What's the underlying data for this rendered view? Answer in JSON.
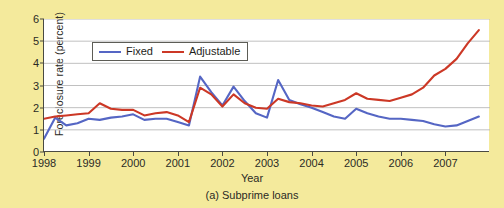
{
  "figure": {
    "caption": "(a) Subprime loans",
    "background_color": "#f4ea9c"
  },
  "chart_data": {
    "type": "line",
    "title": "",
    "xlabel": "Year",
    "ylabel": "Foreclosure rate (percent)",
    "xlim": [
      1998,
      2008
    ],
    "ylim": [
      0,
      6
    ],
    "xticks": [
      "1998",
      "1999",
      "2000",
      "2001",
      "2002",
      "2003",
      "2004",
      "2005",
      "2006",
      "2007"
    ],
    "xtick_values": [
      1998,
      1999,
      2000,
      2001,
      2002,
      2003,
      2004,
      2005,
      2006,
      2007
    ],
    "yticks": [
      "0",
      "1",
      "2",
      "3",
      "4",
      "5",
      "6"
    ],
    "ytick_values": [
      0,
      1,
      2,
      3,
      4,
      5,
      6
    ],
    "grid": "horizontal",
    "legend_position": "top-left",
    "series": [
      {
        "name": "Fixed",
        "color": "#5566c4",
        "x": [
          1998.0,
          1998.25,
          1998.5,
          1998.75,
          1999.0,
          1999.25,
          1999.5,
          1999.75,
          2000.0,
          2000.25,
          2000.5,
          2000.75,
          2001.0,
          2001.25,
          2001.5,
          2001.75,
          2002.0,
          2002.25,
          2002.5,
          2002.75,
          2003.0,
          2003.25,
          2003.5,
          2003.75,
          2004.0,
          2004.25,
          2004.5,
          2004.75,
          2005.0,
          2005.25,
          2005.5,
          2005.75,
          2006.0,
          2006.25,
          2006.5,
          2006.75,
          2007.0,
          2007.25,
          2007.5,
          2007.75
        ],
        "y": [
          0.6,
          1.55,
          1.2,
          1.3,
          1.5,
          1.45,
          1.55,
          1.6,
          1.7,
          1.45,
          1.5,
          1.5,
          1.35,
          1.2,
          3.4,
          2.7,
          2.1,
          2.95,
          2.3,
          1.75,
          1.55,
          3.25,
          2.35,
          2.15,
          2.0,
          1.8,
          1.6,
          1.5,
          1.95,
          1.75,
          1.6,
          1.5,
          1.5,
          1.45,
          1.4,
          1.25,
          1.15,
          1.2,
          1.4,
          1.6
        ]
      },
      {
        "name": "Adjustable",
        "color": "#cc3826",
        "x": [
          1998.0,
          1998.25,
          1998.5,
          1998.75,
          1999.0,
          1999.25,
          1999.5,
          1999.75,
          2000.0,
          2000.25,
          2000.5,
          2000.75,
          2001.0,
          2001.25,
          2001.5,
          2001.75,
          2002.0,
          2002.25,
          2002.5,
          2002.75,
          2003.0,
          2003.25,
          2003.5,
          2003.75,
          2004.0,
          2004.25,
          2004.5,
          2004.75,
          2005.0,
          2005.25,
          2005.5,
          2005.75,
          2006.0,
          2006.25,
          2006.5,
          2006.75,
          2007.0,
          2007.25,
          2007.5,
          2007.75
        ],
        "y": [
          1.5,
          1.6,
          1.65,
          1.7,
          1.75,
          2.2,
          1.95,
          1.9,
          1.9,
          1.65,
          1.75,
          1.8,
          1.65,
          1.35,
          2.9,
          2.6,
          2.05,
          2.6,
          2.2,
          2.0,
          1.95,
          2.4,
          2.25,
          2.2,
          2.1,
          2.05,
          2.2,
          2.35,
          2.65,
          2.4,
          2.35,
          2.3,
          2.45,
          2.6,
          2.9,
          3.45,
          3.75,
          4.2,
          4.9,
          5.5
        ]
      }
    ]
  }
}
